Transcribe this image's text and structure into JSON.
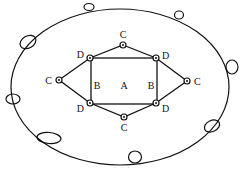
{
  "diagram": {
    "stroke_color": "#111111",
    "background": "#ffffff",
    "outer_ellipse": {
      "cx": 120,
      "cy": 87,
      "rx": 109,
      "ry": 78
    },
    "outer_ovals": [
      {
        "cx": 89,
        "cy": 7,
        "rx": 5,
        "ry": 3.5,
        "rot": 0
      },
      {
        "cx": 179,
        "cy": 15,
        "rx": 4.5,
        "ry": 4,
        "rot": 0
      },
      {
        "cx": 28,
        "cy": 42,
        "rx": 8.5,
        "ry": 6,
        "rot": -30
      },
      {
        "cx": 232,
        "cy": 67,
        "rx": 6,
        "ry": 7,
        "rot": 0
      },
      {
        "cx": 13,
        "cy": 99,
        "rx": 7,
        "ry": 5,
        "rot": 0
      },
      {
        "cx": 212,
        "cy": 126,
        "rx": 8,
        "ry": 5.5,
        "rot": -25
      },
      {
        "cx": 49,
        "cy": 138,
        "rx": 12,
        "ry": 5.5,
        "rot": 5
      },
      {
        "cx": 135,
        "cy": 157,
        "rx": 6.5,
        "ry": 6,
        "rot": 0
      }
    ],
    "rectangle": {
      "x": 91,
      "y": 58,
      "w": 66,
      "h": 46
    },
    "hexagon_points": "123,45 156,58 187,81 156,103 124,117 90,103 59,80 90,58",
    "nodes": [
      {
        "id": "C-top",
        "cx": 123,
        "cy": 45,
        "label": "C",
        "lx": 123,
        "ly": 38,
        "anchor": "middle"
      },
      {
        "id": "C-left",
        "cx": 59,
        "cy": 80,
        "label": "C",
        "lx": 52,
        "ly": 84,
        "anchor": "end"
      },
      {
        "id": "C-right",
        "cx": 187,
        "cy": 81,
        "label": "C",
        "lx": 194,
        "ly": 85,
        "anchor": "start"
      },
      {
        "id": "C-bottom",
        "cx": 124,
        "cy": 117,
        "label": "C",
        "lx": 124,
        "ly": 131,
        "anchor": "middle"
      },
      {
        "id": "D-tl",
        "cx": 90,
        "cy": 58,
        "label": "D",
        "lx": 84,
        "ly": 58,
        "anchor": "end"
      },
      {
        "id": "D-tr",
        "cx": 156,
        "cy": 58,
        "label": "D",
        "lx": 162,
        "ly": 59,
        "anchor": "start"
      },
      {
        "id": "D-bl",
        "cx": 90,
        "cy": 103,
        "label": "D",
        "lx": 84,
        "ly": 112,
        "anchor": "end"
      },
      {
        "id": "D-br",
        "cx": 156,
        "cy": 103,
        "label": "D",
        "lx": 162,
        "ly": 112,
        "anchor": "start"
      }
    ],
    "region_labels": [
      {
        "text": "B",
        "x": 97,
        "y": 89
      },
      {
        "text": "A",
        "x": 124,
        "y": 89
      },
      {
        "text": "B",
        "x": 151,
        "y": 89
      }
    ],
    "caption": "· · ·"
  }
}
